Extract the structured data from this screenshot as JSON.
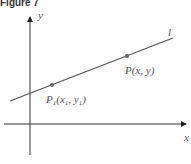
{
  "figure": {
    "title": "Figure 7",
    "axes": {
      "x_label": "x",
      "y_label": "y"
    },
    "line": {
      "label": "l"
    },
    "points": [
      {
        "name": "P1",
        "label_main": "P",
        "label_sub": "1",
        "label_rest": "(x",
        "label_sub2": "1",
        "label_rest2": ", y",
        "label_sub3": "1",
        "label_end": ")"
      },
      {
        "name": "P",
        "label": "P(x, y)"
      }
    ],
    "colors": {
      "axis": "#333333",
      "line": "#555555",
      "point": "#666666",
      "text": "#555555"
    }
  }
}
